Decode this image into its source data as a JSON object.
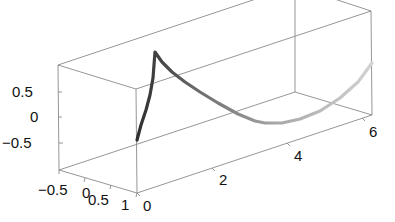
{
  "chart_data": {
    "type": "line",
    "projection": "3d",
    "title": "",
    "xlabel": "",
    "ylabel": "",
    "zlabel": "",
    "x_ticks": [
      "0",
      "2",
      "4",
      "6"
    ],
    "y_ticks": [
      "-0.5",
      "0",
      "0.5",
      "1"
    ],
    "z_ticks": [
      "-0.5",
      "0",
      "0.5"
    ],
    "xlim": [
      0,
      6.28
    ],
    "ylim": [
      -0.5,
      1
    ],
    "zlim": [
      -1,
      1
    ],
    "grid": false,
    "box": true,
    "series": [
      {
        "name": "curve",
        "color_start": "#2e2e2e",
        "color_end": "#d0d0d0",
        "description": "3D curve starting at x=0 low, sharp cusp peak near x~0.2, then a smooth arc dipping to a minimum near x~3 and rising toward x~6.28",
        "screen_points": [
          [
            137,
            140
          ],
          [
            141,
            125
          ],
          [
            146,
            110
          ],
          [
            150,
            95
          ],
          [
            153,
            78
          ],
          [
            155,
            52
          ],
          [
            162,
            62
          ],
          [
            172,
            72
          ],
          [
            185,
            82
          ],
          [
            200,
            92
          ],
          [
            218,
            103
          ],
          [
            238,
            114
          ],
          [
            255,
            121
          ],
          [
            265,
            123
          ],
          [
            282,
            123
          ],
          [
            300,
            119
          ],
          [
            320,
            111
          ],
          [
            340,
            98
          ],
          [
            358,
            82
          ],
          [
            372,
            63
          ]
        ]
      }
    ]
  },
  "axes": {
    "z_labels": [
      {
        "text": "0.5",
        "x": 12,
        "y": 97
      },
      {
        "text": "0",
        "x": 30,
        "y": 122
      },
      {
        "text": "−0.5",
        "x": 2,
        "y": 148
      }
    ],
    "y_labels": [
      {
        "text": "−0.5",
        "x": 38,
        "y": 195
      },
      {
        "text": "0",
        "x": 82,
        "y": 198
      },
      {
        "text": "0.5",
        "x": 88,
        "y": 205
      },
      {
        "text": "1",
        "x": 121,
        "y": 210
      }
    ],
    "x_labels": [
      {
        "text": "0",
        "x": 143,
        "y": 211
      },
      {
        "text": "2",
        "x": 219,
        "y": 185
      },
      {
        "text": "4",
        "x": 294,
        "y": 161
      },
      {
        "text": "6",
        "x": 369,
        "y": 137
      }
    ]
  }
}
